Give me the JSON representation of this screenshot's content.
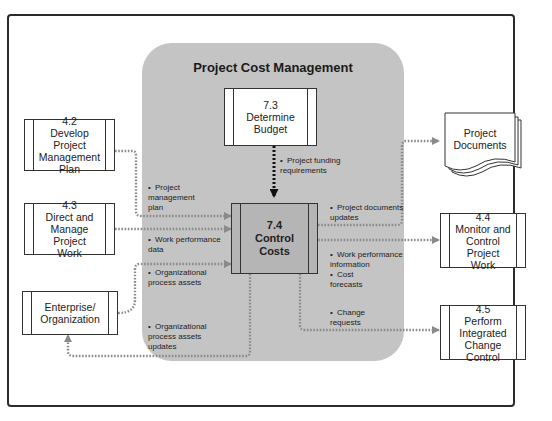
{
  "diagram": {
    "title": "Project Cost Management",
    "processes": {
      "determine_budget": {
        "id": "7.3",
        "label": "7.3\nDetermine\nBudget"
      },
      "control_costs": {
        "id": "7.4",
        "label": "7.4\nControl\nCosts"
      },
      "develop_pm_plan": {
        "id": "4.2",
        "label": "4.2\nDevelop Project\nManagement\nPlan"
      },
      "direct_manage": {
        "id": "4.3",
        "label": "4.3\nDirect and\nManage Project\nWork"
      },
      "enterprise": {
        "label": "Enterprise/\nOrganization"
      },
      "monitor_control": {
        "id": "4.4",
        "label": "4.4\nMonitor and\nControl Project\nWork"
      },
      "integrated_change": {
        "id": "4.5",
        "label": "4.5\nPerform\nIntegrated\nChange Control"
      }
    },
    "document": {
      "label": "Project\nDocuments"
    },
    "flows": {
      "funding": "Project funding\nrequirements",
      "pm_plan": "Project\nmanagement\nplan",
      "work_perf_data": "Work performance\ndata",
      "opa": "Organizational\nprocess assets",
      "opa_updates": "Organizational\nprocess assets\nupdates",
      "doc_updates": "Project documents\nupdates",
      "work_perf_info": "Work performance\ninformation",
      "cost_forecasts": "Cost\nforecasts",
      "change_requests": "Change\nrequests"
    },
    "bullet": "•",
    "colors": {
      "region": "#c4c4c4",
      "main_process": "#b5b5b5",
      "arrow_gray": "#8a8a8a",
      "arrow_black": "#111111",
      "border": "#333333"
    }
  }
}
